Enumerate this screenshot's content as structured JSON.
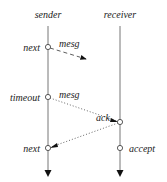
{
  "diagram": {
    "lifelines": [
      {
        "name": "sender",
        "x": 48
      },
      {
        "name": "receiver",
        "x": 120
      }
    ],
    "events": [
      {
        "label": "next",
        "lifeline": "sender",
        "y": 47
      },
      {
        "label": "timeout",
        "lifeline": "sender",
        "y": 97
      },
      {
        "label": "ack",
        "lifeline": "receiver",
        "y": 122
      },
      {
        "label": "next",
        "lifeline": "sender",
        "y": 148
      },
      {
        "label": "accept",
        "lifeline": "receiver",
        "y": 148
      }
    ],
    "messages": [
      {
        "label": "mesg",
        "from": "sender",
        "style": "dashed",
        "lost": true
      },
      {
        "label": "mesg",
        "from": "sender",
        "to": "receiver",
        "style": "dotted"
      },
      {
        "label": "ack",
        "from": "receiver",
        "to": "sender",
        "style": "dotted"
      }
    ]
  },
  "labels": {
    "sender": "sender",
    "receiver": "receiver",
    "next1": "next",
    "mesg1": "mesg",
    "timeout": "timeout",
    "mesg2": "mesg",
    "ack": "ack",
    "next2": "next",
    "accept": "accept"
  }
}
